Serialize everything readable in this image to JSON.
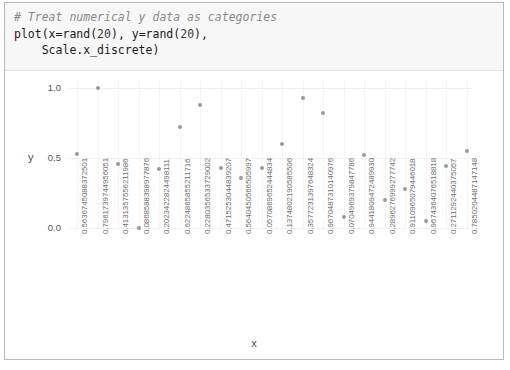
{
  "code": {
    "comment": "# Treat numerical y data as categories",
    "line2_pre": "plot(x=rand(",
    "line2_n1": "20",
    "line2_mid": "), y=rand(",
    "line2_n2": "20",
    "line2_post": "),",
    "line3": "    Scale.x_discrete)"
  },
  "chart_data": {
    "type": "scatter",
    "title": "",
    "xlabel": "x",
    "ylabel": "y",
    "ylim": [
      -0.08,
      1.08
    ],
    "yticks": [
      "1.0",
      "0.5",
      "0.0"
    ],
    "ytick_values": [
      1.0,
      0.5,
      0.0
    ],
    "grid": true,
    "legend": "none",
    "x_scale": "discrete",
    "categories": [
      "0.5636745088372501",
      "0.7961739744956051",
      "0.4131357556211986",
      "0.0868588398977876",
      "0.2023422824498111",
      "0.6224865855211716",
      "0.2280356533729002",
      "0.4715253044839207",
      "0.5640450566505997",
      "0.0570869652444834",
      "0.1374802190585506",
      "0.3577231397648324",
      "0.9670487310140976",
      "0.0704969379847786",
      "0.9441809472489930",
      "0.2896276999277742",
      "0.9110965079446018",
      "0.9674364076518818",
      "0.2711292440375057",
      "0.7850204487147148"
    ],
    "values": [
      0.53,
      1.0,
      0.46,
      0.0,
      0.42,
      0.72,
      0.88,
      0.43,
      0.36,
      0.43,
      0.6,
      0.93,
      0.82,
      0.08,
      0.52,
      0.2,
      0.28,
      0.05,
      0.44,
      0.55
    ]
  },
  "below_strip": {
    "text": ""
  }
}
